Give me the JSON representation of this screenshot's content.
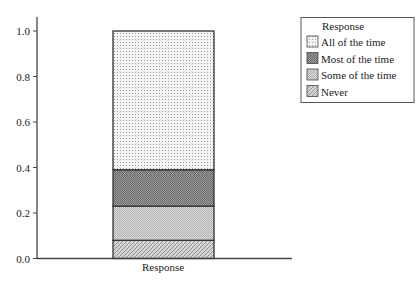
{
  "chart_data": {
    "type": "bar",
    "stacked": true,
    "categories": [
      "Response"
    ],
    "series": [
      {
        "name": "Never",
        "values": [
          0.08
        ]
      },
      {
        "name": "Some of the time",
        "values": [
          0.15
        ]
      },
      {
        "name": "Most of the time",
        "values": [
          0.16
        ]
      },
      {
        "name": "All of the time",
        "values": [
          0.61
        ]
      }
    ],
    "title": "",
    "xlabel": "",
    "ylabel": "",
    "ylim": [
      0,
      1.0
    ],
    "yticks": [
      "0.0",
      "0.2",
      "0.4",
      "0.6",
      "0.8",
      "1.0"
    ],
    "grid": false,
    "legend_position": "upper right",
    "legend": {
      "title": "Response",
      "entries": [
        "All of the time",
        "Most of the time",
        "Some of the time",
        "Never"
      ]
    }
  },
  "axis": {
    "xtick_label": "Response",
    "yticks": [
      "0.0",
      "0.2",
      "0.4",
      "0.6",
      "0.8",
      "1.0"
    ]
  },
  "legend": {
    "title": "Response",
    "items": [
      {
        "label": "All of the time",
        "pattern": "dots"
      },
      {
        "label": "Most of the time",
        "pattern": "dark-check"
      },
      {
        "label": "Some of the time",
        "pattern": "light-check"
      },
      {
        "label": "Never",
        "pattern": "hatch"
      }
    ]
  }
}
